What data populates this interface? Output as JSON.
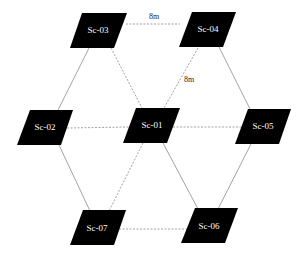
{
  "diagram": {
    "nodes": [
      {
        "id": "Sc-03",
        "label": "Sc-03",
        "cx": 98,
        "cy": 31
      },
      {
        "id": "Sc-04",
        "label": "Sc-04",
        "cx": 208,
        "cy": 30
      },
      {
        "id": "Sc-02",
        "label": "Sc-02",
        "cx": 45,
        "cy": 127
      },
      {
        "id": "Sc-01",
        "label": "Sc-01",
        "cx": 152,
        "cy": 126
      },
      {
        "id": "Sc-05",
        "label": "Sc-05",
        "cx": 263,
        "cy": 127
      },
      {
        "id": "Sc-07",
        "label": "Sc-07",
        "cx": 97,
        "cy": 228
      },
      {
        "id": "Sc-06",
        "label": "Sc-06",
        "cx": 209,
        "cy": 226
      }
    ],
    "edges": [
      {
        "from": "Sc-03",
        "to": "Sc-04",
        "style": "dashed",
        "label": "8m"
      },
      {
        "from": "Sc-04",
        "to": "Sc-01",
        "style": "dashed",
        "label": "8m"
      },
      {
        "from": "Sc-03",
        "to": "Sc-01",
        "style": "dashed",
        "label": ""
      },
      {
        "from": "Sc-03",
        "to": "Sc-02",
        "style": "solid",
        "label": ""
      },
      {
        "from": "Sc-04",
        "to": "Sc-05",
        "style": "solid",
        "label": ""
      },
      {
        "from": "Sc-02",
        "to": "Sc-01",
        "style": "dashed",
        "label": ""
      },
      {
        "from": "Sc-01",
        "to": "Sc-05",
        "style": "dashed",
        "label": ""
      },
      {
        "from": "Sc-02",
        "to": "Sc-07",
        "style": "solid",
        "label": ""
      },
      {
        "from": "Sc-01",
        "to": "Sc-07",
        "style": "dashed",
        "label": ""
      },
      {
        "from": "Sc-01",
        "to": "Sc-06",
        "style": "solid",
        "label": ""
      },
      {
        "from": "Sc-05",
        "to": "Sc-06",
        "style": "solid",
        "label": ""
      },
      {
        "from": "Sc-07",
        "to": "Sc-06",
        "style": "dashed",
        "label": ""
      }
    ],
    "edge_labels": {
      "top": "8m",
      "diagonal": "8m"
    },
    "colors": {
      "node_fill": "#000000",
      "node_text": "#ffffff",
      "edge": "#8a8a8a",
      "background": "#ffffff"
    }
  }
}
